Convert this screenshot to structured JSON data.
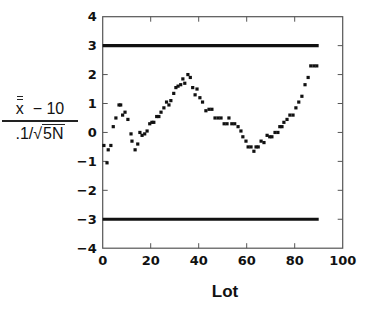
{
  "chart_data": {
    "type": "scatter",
    "title": "",
    "xlabel": "Lot",
    "ylabel": {
      "numerator_symbol": "x",
      "numerator_rest": "  − 10",
      "denominator_prefix": ".1/√",
      "denominator_radicand": "5N",
      "full": "(x̿ − 10) / (.1/√5N)"
    },
    "xlim": [
      0,
      100
    ],
    "ylim": [
      -4,
      4
    ],
    "xticks": [
      0,
      20,
      40,
      60,
      80,
      100
    ],
    "yticks": [
      -4,
      -3,
      -2,
      -1,
      0,
      1,
      2,
      3,
      4
    ],
    "grid": false,
    "legend": null,
    "reference_lines": [
      {
        "name": "upper-control-limit",
        "y": 3,
        "x_start": 0,
        "x_end": 90
      },
      {
        "name": "lower-control-limit",
        "y": -3,
        "x_start": 0,
        "x_end": 90
      }
    ],
    "series": [
      {
        "name": "standardized mean",
        "x": [
          0.5,
          1.8,
          2.3,
          3.4,
          4.4,
          5.5,
          6.8,
          7.5,
          8.3,
          9.3,
          10.5,
          11.8,
          12.2,
          13.5,
          14.6,
          15.5,
          16.4,
          17.5,
          18.5,
          19.6,
          20.5,
          21.3,
          22.5,
          23.4,
          24.3,
          25.5,
          26.6,
          27.6,
          28.4,
          29.6,
          30.5,
          31.4,
          32.5,
          33.4,
          34.2,
          35.5,
          36.5,
          37.5,
          38.5,
          39.3,
          40.5,
          41.6,
          43.0,
          44.3,
          45.5,
          46.8,
          48.1,
          49.3,
          50.6,
          51.8,
          52.6,
          53.8,
          55.0,
          56.4,
          57.6,
          58.4,
          59.7,
          60.6,
          61.8,
          63.0,
          63.9,
          64.8,
          66.0,
          67.2,
          68.5,
          69.6,
          70.5,
          71.8,
          73.0,
          73.8,
          74.7,
          75.5,
          76.8,
          78.0,
          79.3,
          80.5,
          81.7,
          83.0,
          84.3,
          85.6,
          86.7,
          88.0,
          89.2
        ],
        "y": [
          -0.45,
          -1.05,
          -0.6,
          -0.45,
          0.2,
          0.5,
          0.95,
          0.95,
          0.6,
          0.7,
          0.45,
          -0.05,
          -0.3,
          -0.6,
          -0.4,
          0.0,
          -0.1,
          -0.05,
          0.05,
          0.3,
          0.35,
          0.35,
          0.55,
          0.55,
          0.7,
          0.85,
          1.05,
          0.95,
          1.1,
          1.35,
          1.55,
          1.6,
          1.65,
          1.85,
          1.7,
          2.0,
          1.9,
          1.55,
          1.3,
          1.5,
          1.2,
          1.05,
          0.75,
          0.8,
          0.8,
          0.5,
          0.5,
          0.5,
          0.3,
          0.3,
          0.5,
          0.3,
          0.3,
          0.2,
          0.05,
          -0.15,
          -0.3,
          -0.5,
          -0.5,
          -0.65,
          -0.5,
          -0.5,
          -0.3,
          -0.35,
          -0.1,
          -0.15,
          -0.15,
          0.0,
          0.0,
          0.2,
          0.2,
          0.35,
          0.45,
          0.6,
          0.6,
          0.85,
          1.05,
          1.25,
          1.65,
          1.9,
          2.3,
          2.3,
          2.3
        ]
      }
    ]
  },
  "colors": {
    "axis": "#555555",
    "points": "#111111",
    "limit_lines": "#111111",
    "tick_labels": "#111111"
  }
}
